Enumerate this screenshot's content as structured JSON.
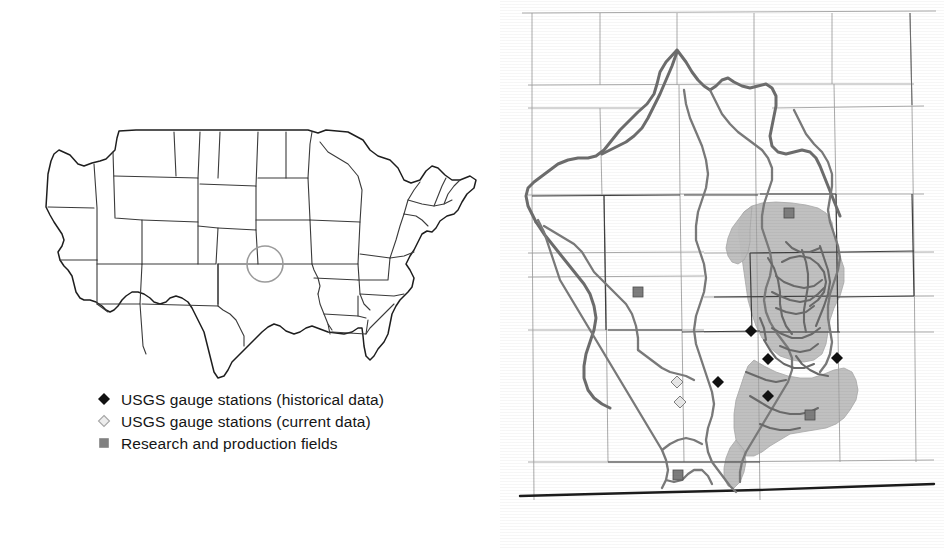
{
  "figure": {
    "panels": [
      "national-locator-map",
      "basin-detail-map"
    ]
  },
  "colors": {
    "outline": "#1a1a1a",
    "state_border": "#2b2b2b",
    "county_grid": "#8f8f8f",
    "river": "#6b6b6b",
    "river_dark": "#4a4a4a",
    "watershed": "#5c5c5c",
    "shaded_field": "#b9b9b9",
    "marker_historical": "#111111",
    "marker_current": "#e8e8e8",
    "marker_current_edge": "#9a9a9a",
    "marker_field": "#808080",
    "highlight_circle": "#9b9b9b",
    "background": "#ffffff"
  },
  "locator_map": {
    "name": "United States outline map",
    "highlight": {
      "shape": "circle",
      "label": "study-area-highlight",
      "cx": 247,
      "cy": 136,
      "r": 18
    }
  },
  "legend": {
    "title": "",
    "items": [
      {
        "marker": "filled-diamond",
        "marker_color": "#111111",
        "label": "USGS gauge stations (historical data)"
      },
      {
        "marker": "open-diamond",
        "marker_color": "#e8e8e8",
        "label": "USGS gauge stations (current data)"
      },
      {
        "marker": "filled-square",
        "marker_color": "#808080",
        "label": "Research and production fields"
      }
    ]
  },
  "basin_map": {
    "name": "Basin detail map with county grid, streams and study sites",
    "gauge_stations_historical": [
      {
        "x": 237,
        "y": 331
      },
      {
        "x": 254,
        "y": 359
      },
      {
        "x": 323,
        "y": 358
      },
      {
        "x": 254,
        "y": 396
      },
      {
        "x": 204,
        "y": 382
      }
    ],
    "gauge_stations_current": [
      {
        "x": 163,
        "y": 382
      },
      {
        "x": 166,
        "y": 402
      }
    ],
    "research_fields": [
      {
        "x": 275,
        "y": 213
      },
      {
        "x": 124,
        "y": 292
      },
      {
        "x": 296,
        "y": 415
      },
      {
        "x": 164,
        "y": 475
      }
    ]
  }
}
